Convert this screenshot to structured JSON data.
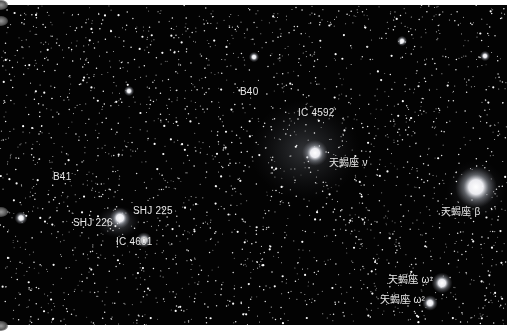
{
  "image": {
    "subject": "Star field in Scorpius with nebulae (Antares/Rho Ophiuchi region edge)",
    "colors": {
      "background": "#030303",
      "border": "#ffffff",
      "label": "#e8e8e8",
      "nebula": "#8a8f9a"
    }
  },
  "labels": [
    {
      "id": "b40",
      "text": "B40",
      "x": 240,
      "y": 91
    },
    {
      "id": "ic4592",
      "text": "IC 4592",
      "x": 298,
      "y": 112
    },
    {
      "id": "sco-nu",
      "text": "天蝎座 ν",
      "x": 329,
      "y": 162
    },
    {
      "id": "b41",
      "text": "B41",
      "x": 53,
      "y": 176
    },
    {
      "id": "shj225",
      "text": "SHJ 225",
      "x": 133,
      "y": 210
    },
    {
      "id": "shj226",
      "text": "SHJ 226",
      "x": 73,
      "y": 222
    },
    {
      "id": "ic4601",
      "text": "IC 4601",
      "x": 116,
      "y": 241
    },
    {
      "id": "sco-beta",
      "text": "天蝎座 β",
      "x": 441,
      "y": 211
    },
    {
      "id": "sco-omega1",
      "text": "天蝎座 ω¹",
      "x": 388,
      "y": 279
    },
    {
      "id": "sco-omega2",
      "text": "天蝎座 ω²",
      "x": 380,
      "y": 299
    }
  ],
  "bright_stars": [
    {
      "name": "nu-sco",
      "x": 315,
      "y": 153,
      "r": 5
    },
    {
      "name": "beta-sco",
      "x": 476,
      "y": 187,
      "r": 8
    },
    {
      "name": "omega1-sco",
      "x": 442,
      "y": 283,
      "r": 4
    },
    {
      "name": "omega2-sco",
      "x": 430,
      "y": 303,
      "r": 3
    },
    {
      "name": "shj225-star",
      "x": 120,
      "y": 218,
      "r": 4
    },
    {
      "name": "ic4601-star",
      "x": 144,
      "y": 240,
      "r": 3
    },
    {
      "name": "field-star-1",
      "x": 21,
      "y": 218,
      "r": 2.5
    },
    {
      "name": "field-star-2",
      "x": 254,
      "y": 57,
      "r": 2
    },
    {
      "name": "field-star-3",
      "x": 485,
      "y": 56,
      "r": 2
    },
    {
      "name": "field-star-4",
      "x": 402,
      "y": 41,
      "r": 2
    },
    {
      "name": "field-star-5",
      "x": 129,
      "y": 91,
      "r": 2
    }
  ],
  "nebulae": [
    {
      "name": "ic4592-nebula",
      "x": 305,
      "y": 150,
      "rx": 55,
      "ry": 50,
      "opacity": 0.32
    },
    {
      "name": "ic4601-nebula",
      "x": 118,
      "y": 222,
      "rx": 22,
      "ry": 16,
      "opacity": 0.55
    },
    {
      "name": "beta-halo",
      "x": 476,
      "y": 190,
      "rx": 30,
      "ry": 30,
      "opacity": 0.28
    }
  ],
  "starfield": {
    "count": 2600,
    "seed": 4592
  }
}
